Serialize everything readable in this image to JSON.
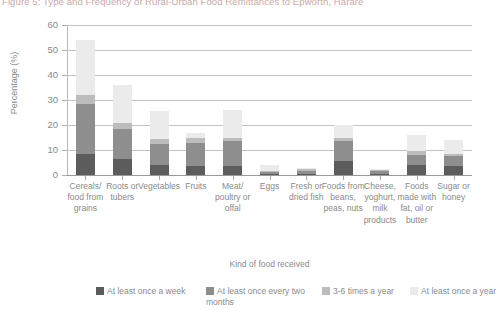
{
  "figure": {
    "title": "Figure 5: Type and Frequency of Rural-Urban Food Remittances to Epworth, Harare"
  },
  "chart_data": {
    "type": "bar",
    "stacked": true,
    "title": "Figure 5: Type and Frequency of Rural-Urban Food Remittances to Epworth, Harare",
    "xlabel": "Kind of food received",
    "ylabel": "Percentage (%)",
    "ylim": [
      0,
      60
    ],
    "yticks": [
      0,
      10,
      20,
      30,
      40,
      50,
      60
    ],
    "grid": true,
    "legend_position": "bottom",
    "categories": [
      "Cereals/ food from grains",
      "Roots or tubers",
      "Vegetables",
      "Fruits",
      "Meat/ poultry or offal",
      "Eggs",
      "Fresh or dried fish",
      "Foods from beans, peas, nuts",
      "Cheese, yoghurt, milk products",
      "Foods made with fat, oil or butter",
      "Sugar or honey"
    ],
    "series": [
      {
        "name": "At least once a week",
        "color": "#5c5c5c",
        "values": [
          8.5,
          6.5,
          4.0,
          3.5,
          3.5,
          0.5,
          0.6,
          5.5,
          0.6,
          4.0,
          3.5
        ]
      },
      {
        "name": "At least once every two months",
        "color": "#8e8e8e",
        "values": [
          20.0,
          12.0,
          8.5,
          9.5,
          10.0,
          0.7,
          1.2,
          8.0,
          0.9,
          4.0,
          4.0
        ]
      },
      {
        "name": "3-6 times a year",
        "color": "#bcbcbc",
        "values": [
          3.5,
          2.5,
          2.0,
          2.0,
          1.5,
          0.5,
          0.5,
          1.5,
          0.5,
          1.5,
          1.0
        ]
      },
      {
        "name": "At least once a year",
        "color": "#ebebeb",
        "values": [
          22.0,
          15.0,
          11.0,
          2.0,
          11.0,
          2.3,
          0.7,
          5.0,
          0.5,
          6.5,
          5.5
        ]
      }
    ],
    "totals": [
      54.0,
      36.0,
      25.5,
      17.0,
      26.0,
      4.0,
      3.0,
      20.0,
      2.5,
      16.0,
      14.0
    ]
  },
  "axis": {
    "y_title": "Percentage (%)",
    "x_title": "Kind of food received",
    "y_ticks": [
      "60",
      "50",
      "40",
      "30",
      "20",
      "10",
      "0"
    ]
  },
  "legend": {
    "items": [
      {
        "label": "At least once a week",
        "color": "#5c5c5c"
      },
      {
        "label": "At least once every two months",
        "color": "#8e8e8e"
      },
      {
        "label": "3-6 times a year",
        "color": "#bcbcbc"
      },
      {
        "label": "At least once a year",
        "color": "#ebebeb"
      }
    ]
  }
}
